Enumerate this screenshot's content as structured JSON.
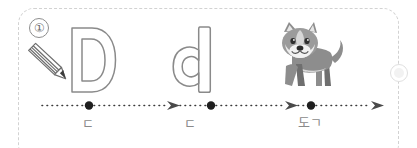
{
  "worksheet": {
    "item_number": "①",
    "border_color": "#d2d2d2",
    "ink_color": "#7d7d7d",
    "label_color": "#8a8a8a"
  },
  "tracing": {
    "uppercase_letter": "D",
    "lowercase_letter": "d",
    "pencil_icon": "pencil-icon",
    "picture_icon": "dog-illustration"
  },
  "stations": [
    {
      "id": "station-1",
      "label": "ㄷ",
      "marker": "dot"
    },
    {
      "id": "station-2",
      "label": "ㄷ",
      "marker": "dot"
    },
    {
      "id": "station-3",
      "label": "도ㄱ",
      "marker": "dot"
    }
  ],
  "arrows": {
    "count": 3,
    "style": "dotted-with-arrowhead"
  }
}
